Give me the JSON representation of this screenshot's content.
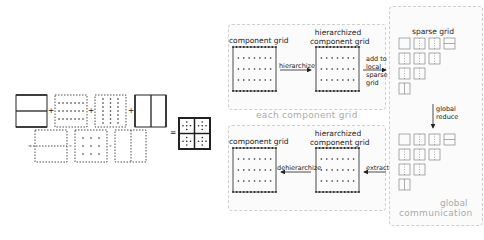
{
  "diagram": {
    "combination": {
      "operators": [
        "+",
        "+",
        "+",
        "-",
        "-",
        "-",
        "="
      ],
      "description": "combination technique: sum of anisotropic component grids minus overlapping grids equals sparse grid"
    },
    "each_panel": {
      "title": "each component grid",
      "top_left_label": "component grid",
      "top_right_label": "hierarchized component grid",
      "top_right_line1": "hierarchized",
      "top_right_line2": "component grid",
      "top_arrow": "hierarchize",
      "bottom_left_label": "component grid",
      "bottom_right_line1": "hierarchized",
      "bottom_right_line2": "component grid",
      "bottom_arrow": "dehierarchize"
    },
    "global_panel": {
      "title_line1": "global",
      "title_line2": "communication",
      "sparse_grid_label": "sparse grid",
      "reduce_line1": "global",
      "reduce_line2": "reduce"
    },
    "arrows": {
      "add_line1": "add to",
      "add_line2": "local",
      "add_line3": "sparse",
      "add_line4": "grid",
      "extract": "extract"
    },
    "colors": {
      "line": "#222222",
      "panel_border": "#cfcfcf",
      "panel_title": "#aaaaaa",
      "sparse_cell": "#888888"
    }
  }
}
